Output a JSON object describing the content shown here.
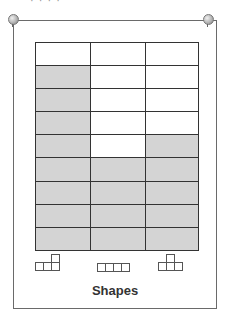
{
  "header": {
    "cropped_text": "· ·  · ·"
  },
  "board": {
    "pins": [
      "left",
      "right"
    ],
    "colors": {
      "shaded": "#d4d4d4",
      "empty": "#ffffff",
      "line": "#333333"
    }
  },
  "chart_data": {
    "type": "table",
    "title": "Shapes",
    "categories": [
      "L-shape",
      "I-shape",
      "T-shape"
    ],
    "rows": 9,
    "values": [
      8,
      4,
      5
    ],
    "grid": [
      [
        "empty",
        "empty",
        "empty"
      ],
      [
        "shaded",
        "empty",
        "empty"
      ],
      [
        "shaded",
        "empty",
        "empty"
      ],
      [
        "shaded",
        "empty",
        "empty"
      ],
      [
        "shaded",
        "empty",
        "shaded"
      ],
      [
        "shaded",
        "shaded",
        "shaded"
      ],
      [
        "shaded",
        "shaded",
        "shaded"
      ],
      [
        "shaded",
        "shaded",
        "shaded"
      ],
      [
        "shaded",
        "shaded",
        "shaded"
      ]
    ]
  },
  "shapes": [
    {
      "name": "l-tetromino",
      "squares": [
        [
          0,
          1
        ],
        [
          1,
          1
        ],
        [
          2,
          1
        ],
        [
          2,
          0
        ]
      ]
    },
    {
      "name": "i-tetromino",
      "squares": [
        [
          0,
          0
        ],
        [
          1,
          0
        ],
        [
          2,
          0
        ],
        [
          3,
          0
        ]
      ]
    },
    {
      "name": "t-tetromino",
      "squares": [
        [
          0,
          1
        ],
        [
          1,
          1
        ],
        [
          2,
          1
        ],
        [
          1,
          0
        ]
      ]
    }
  ],
  "label": "Shapes"
}
